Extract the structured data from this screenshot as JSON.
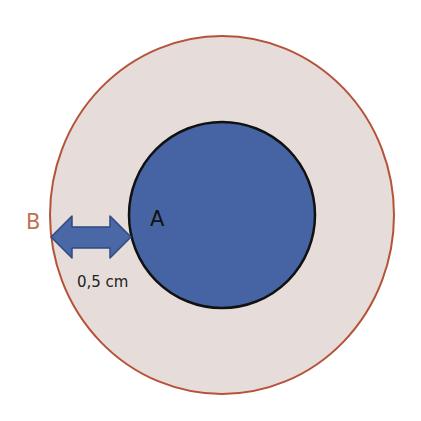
{
  "diagram": {
    "outer_circle": {
      "label": "B",
      "fill": "#e6dcda",
      "stroke": "#b5533a"
    },
    "inner_circle": {
      "label": "A",
      "fill": "#4664a3",
      "stroke": "#111111"
    },
    "arrow": {
      "label": "0,5 cm",
      "fill": "#4a67a6",
      "stroke": "#2e4a80"
    },
    "colors": {
      "label_b": "#c0714f",
      "text": "#222222"
    }
  }
}
